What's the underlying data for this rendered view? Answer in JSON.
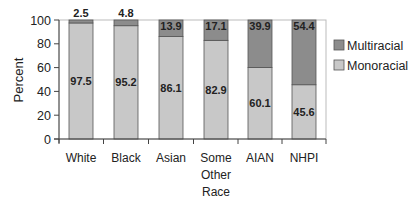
{
  "chart_data": {
    "type": "bar",
    "stacked": true,
    "title": "",
    "xlabel": "",
    "ylabel": "Percent",
    "ylim": [
      0,
      100
    ],
    "yticks": [
      0,
      20,
      40,
      60,
      80,
      100
    ],
    "grid": false,
    "legend_position": "right",
    "categories": [
      [
        "White"
      ],
      [
        "Black"
      ],
      [
        "Asian"
      ],
      [
        "Some",
        "Other",
        "Race"
      ],
      [
        "AIAN"
      ],
      [
        "NHPI"
      ]
    ],
    "category_names": [
      "White",
      "Black",
      "Asian",
      "Some Other Race",
      "AIAN",
      "NHPI"
    ],
    "series": [
      {
        "name": "Monoracial",
        "color": "#c8c8c8",
        "values": [
          97.5,
          95.2,
          86.1,
          82.9,
          60.1,
          45.6
        ]
      },
      {
        "name": "Multiracial",
        "color": "#8c8c8c",
        "values": [
          2.5,
          4.8,
          13.9,
          17.1,
          39.9,
          54.4
        ]
      }
    ],
    "legend": [
      "Multiracial",
      "Monoracial"
    ]
  },
  "style": {
    "border": "#555555",
    "axis": "#444444",
    "text": "#222222"
  }
}
